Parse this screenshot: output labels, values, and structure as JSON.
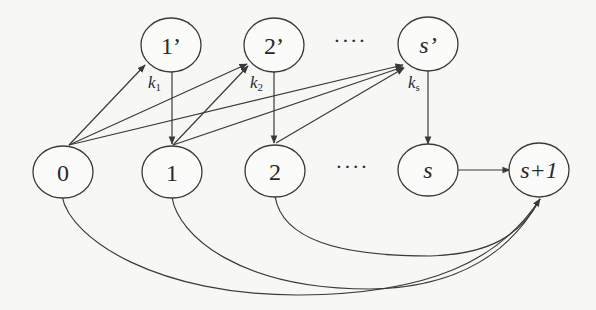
{
  "diagram": {
    "top_nodes": [
      {
        "id": "1p",
        "label": "1’",
        "italic": false
      },
      {
        "id": "2p",
        "label": "2’",
        "italic": false
      },
      {
        "id": "sp",
        "label": "s’",
        "italic": true
      }
    ],
    "bottom_nodes": [
      {
        "id": "0",
        "label": "0",
        "italic": false
      },
      {
        "id": "1",
        "label": "1",
        "italic": false
      },
      {
        "id": "2",
        "label": "2",
        "italic": false
      },
      {
        "id": "s",
        "label": "s",
        "italic": true
      },
      {
        "id": "s1",
        "label": "s+1",
        "italic": true
      }
    ],
    "ellipsis_top": "····",
    "ellipsis_bottom": "····",
    "edge_labels": [
      {
        "edge": "1p->1",
        "base": "k",
        "sub": "1"
      },
      {
        "edge": "2p->2",
        "base": "k",
        "sub": "2"
      },
      {
        "edge": "sp->s",
        "base": "k",
        "sub": "s"
      }
    ],
    "edges": [
      {
        "from": "0",
        "to": "1p"
      },
      {
        "from": "0",
        "to": "2p"
      },
      {
        "from": "0",
        "to": "sp"
      },
      {
        "from": "1",
        "to": "2p"
      },
      {
        "from": "1",
        "to": "sp"
      },
      {
        "from": "2",
        "to": "sp"
      },
      {
        "from": "1p",
        "to": "1"
      },
      {
        "from": "2p",
        "to": "2"
      },
      {
        "from": "sp",
        "to": "s"
      },
      {
        "from": "s",
        "to": "s1"
      },
      {
        "from": "0",
        "to": "s1",
        "curved": true
      },
      {
        "from": "1",
        "to": "s1",
        "curved": true
      },
      {
        "from": "2",
        "to": "s1",
        "curved": true
      }
    ]
  }
}
